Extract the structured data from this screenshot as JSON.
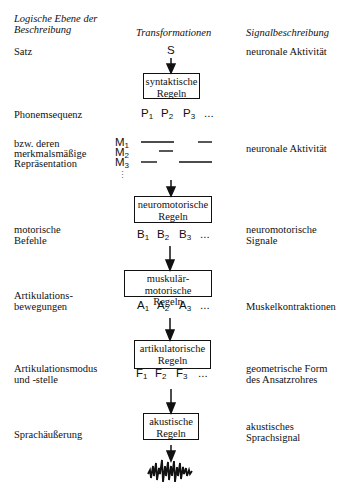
{
  "headers": {
    "level": [
      "Logische Ebene der",
      "Beschreibung"
    ],
    "transform": "Transformationen",
    "signal": "Signalbeschreibung"
  },
  "rows": {
    "satz": {
      "level": "Satz",
      "symbol": "S",
      "signal": "neuronale Aktivität"
    },
    "syntaktisch": {
      "box": [
        "syntaktische",
        "Regeln"
      ]
    },
    "phonem": {
      "level": "Phonemsequenz",
      "symbols": [
        "P",
        "P",
        "P"
      ],
      "subs": [
        "1",
        "2",
        "3"
      ],
      "ellipsis": "..."
    },
    "merkmal": {
      "level": [
        "bzw. deren",
        "merkmalsmäßige",
        "Repräsentation"
      ],
      "symbols": [
        "M",
        "M",
        "M"
      ],
      "subs": [
        "1",
        "2",
        "3"
      ],
      "vdots": "⋮",
      "signal": "neuronale Aktivität"
    },
    "neuromotorisch": {
      "box": [
        "neuromotorische",
        "Regeln"
      ]
    },
    "befehle": {
      "level": [
        "motorische",
        "Befehle"
      ],
      "symbols": [
        "B",
        "B",
        "B"
      ],
      "subs": [
        "1",
        "2",
        "3"
      ],
      "ellipsis": "...",
      "signal": [
        "neuromotorische",
        "Signale"
      ]
    },
    "muskulaer": {
      "box": [
        "muskulär-motorische",
        "Regeln"
      ]
    },
    "bewegungen": {
      "level": [
        "Artikulations-",
        "bewegungen"
      ],
      "symbols": [
        "A",
        "A",
        "A"
      ],
      "subs": [
        "1",
        "2",
        "3"
      ],
      "ellipsis": "...",
      "signal": "Muskelkontraktionen"
    },
    "artikulatorisch": {
      "box": [
        "artikulatorische",
        "Regeln"
      ]
    },
    "modus": {
      "level": [
        "Artikulationsmodus",
        "und -stelle"
      ],
      "symbols": [
        "F",
        "F",
        "F"
      ],
      "subs": [
        "1",
        "2",
        "3"
      ],
      "ellipsis": "...",
      "signal": [
        "geometrische Form",
        "des Ansatzrohres"
      ]
    },
    "akustisch": {
      "box": [
        "akustische",
        "Regeln"
      ]
    },
    "aeusserung": {
      "level": "Sprachäußerung",
      "signal": [
        "akustisches",
        "Sprachsignal"
      ],
      "waveform": "speech-waveform"
    }
  },
  "colors": {
    "ink": "#111111",
    "background": "#ffffff"
  }
}
